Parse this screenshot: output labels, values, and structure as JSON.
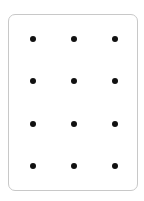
{
  "card": {
    "border_color": "#c8c8c8",
    "background": "#ffffff"
  },
  "grid": {
    "columns": 3,
    "rows": 4,
    "dot_color": "#111111",
    "col_x": [
      33,
      74,
      115
    ],
    "row_y": [
      39,
      81,
      124,
      166
    ]
  }
}
